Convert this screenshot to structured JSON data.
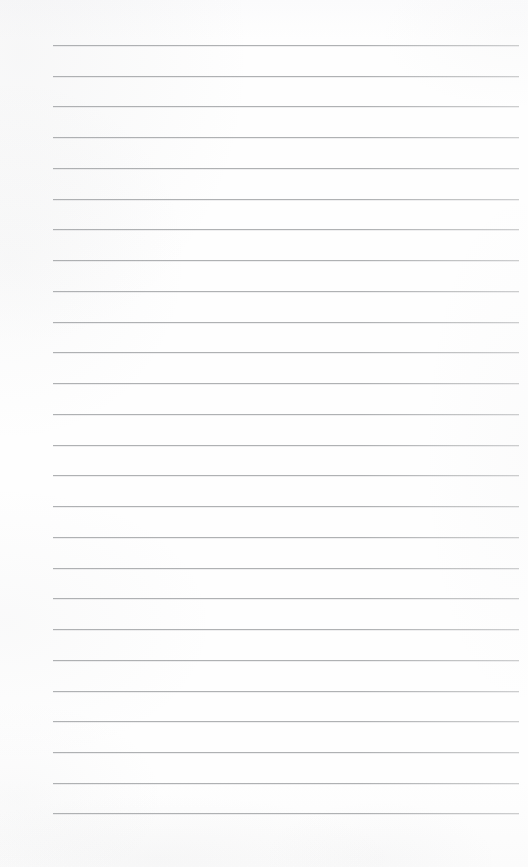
{
  "document": {
    "kind": "scanned-lined-paper",
    "title": "Blank lined notepaper scan",
    "orientation": "portrait",
    "page_width_px": 528,
    "page_height_px": 867,
    "background_color": "#fdfdfd",
    "has_text_content": false,
    "written_content": "",
    "margin_note": "no header, footer, page number, margin rule or handwriting visible"
  },
  "ruling": {
    "line_color": "#a9abad",
    "line_thickness_px": 1,
    "line_count": 26,
    "line_spacing_px": 30.7,
    "first_line_y_px": 45,
    "last_line_y_px": 813,
    "line_start_x_px": 53,
    "line_end_x_px": 519,
    "line_length_px": 466,
    "style": "single-ruled horizontal lines, no vertical margin line"
  },
  "lines": [
    {
      "index": 1,
      "y": 45,
      "label": "rule-line-1"
    },
    {
      "index": 2,
      "y": 76,
      "label": "rule-line-2"
    },
    {
      "index": 3,
      "y": 106,
      "label": "rule-line-3"
    },
    {
      "index": 4,
      "y": 137,
      "label": "rule-line-4"
    },
    {
      "index": 5,
      "y": 168,
      "label": "rule-line-5"
    },
    {
      "index": 6,
      "y": 199,
      "label": "rule-line-6"
    },
    {
      "index": 7,
      "y": 229,
      "label": "rule-line-7"
    },
    {
      "index": 8,
      "y": 260,
      "label": "rule-line-8"
    },
    {
      "index": 9,
      "y": 291,
      "label": "rule-line-9"
    },
    {
      "index": 10,
      "y": 322,
      "label": "rule-line-10"
    },
    {
      "index": 11,
      "y": 352,
      "label": "rule-line-11"
    },
    {
      "index": 12,
      "y": 383,
      "label": "rule-line-12"
    },
    {
      "index": 13,
      "y": 414,
      "label": "rule-line-13"
    },
    {
      "index": 14,
      "y": 445,
      "label": "rule-line-14"
    },
    {
      "index": 15,
      "y": 475,
      "label": "rule-line-15"
    },
    {
      "index": 16,
      "y": 506,
      "label": "rule-line-16"
    },
    {
      "index": 17,
      "y": 537,
      "label": "rule-line-17"
    },
    {
      "index": 18,
      "y": 568,
      "label": "rule-line-18"
    },
    {
      "index": 19,
      "y": 598,
      "label": "rule-line-19"
    },
    {
      "index": 20,
      "y": 629,
      "label": "rule-line-20"
    },
    {
      "index": 21,
      "y": 660,
      "label": "rule-line-21"
    },
    {
      "index": 22,
      "y": 691,
      "label": "rule-line-22"
    },
    {
      "index": 23,
      "y": 721,
      "label": "rule-line-23"
    },
    {
      "index": 24,
      "y": 752,
      "label": "rule-line-24"
    },
    {
      "index": 25,
      "y": 783,
      "label": "rule-line-25"
    },
    {
      "index": 26,
      "y": 813,
      "label": "rule-line-26"
    }
  ]
}
